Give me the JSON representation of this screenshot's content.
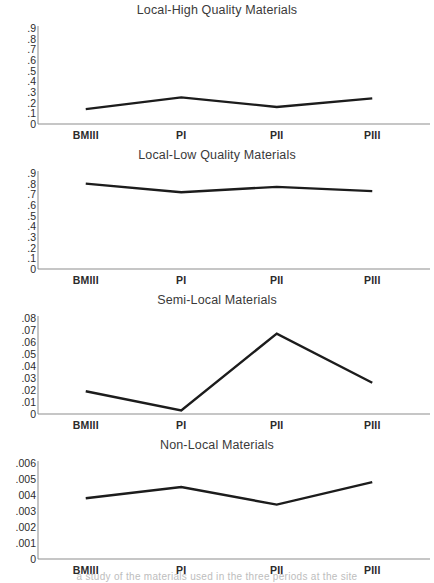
{
  "page": {
    "footer_partial_text": "a study of the materials used in the three periods at the site"
  },
  "chart_data": [
    {
      "type": "line",
      "title": "Local-High Quality Materials",
      "categories": [
        "BMIII",
        "PI",
        "PII",
        "PIII"
      ],
      "values": [
        0.14,
        0.25,
        0.16,
        0.24
      ],
      "yticks": [
        ".9",
        ".8",
        ".7",
        ".6",
        ".5",
        ".4",
        ".3",
        ".2",
        ".1",
        "0"
      ],
      "ytick_values": [
        0.9,
        0.8,
        0.7,
        0.6,
        0.5,
        0.4,
        0.3,
        0.2,
        0.1,
        0
      ],
      "ylim": [
        0,
        0.9
      ],
      "xlabel": "",
      "ylabel": "",
      "grid": false,
      "legend": "none",
      "line_color": "#1c1c1c"
    },
    {
      "type": "line",
      "title": "Local-Low Quality Materials",
      "categories": [
        "BMIII",
        "PI",
        "PII",
        "PIII"
      ],
      "values": [
        0.8,
        0.72,
        0.77,
        0.73
      ],
      "yticks": [
        ".9",
        ".8",
        ".7",
        ".6",
        ".5",
        ".4",
        ".3",
        ".2",
        ".1",
        "0"
      ],
      "ytick_values": [
        0.9,
        0.8,
        0.7,
        0.6,
        0.5,
        0.4,
        0.3,
        0.2,
        0.1,
        0
      ],
      "ylim": [
        0,
        0.9
      ],
      "xlabel": "",
      "ylabel": "",
      "grid": false,
      "legend": "none",
      "line_color": "#1c1c1c"
    },
    {
      "type": "line",
      "title": "Semi-Local Materials",
      "categories": [
        "BMIII",
        "PI",
        "PII",
        "PIII"
      ],
      "values": [
        0.019,
        0.003,
        0.067,
        0.026
      ],
      "yticks": [
        ".08",
        ".07",
        ".06",
        ".05",
        ".04",
        ".03",
        ".02",
        ".01",
        "0"
      ],
      "ytick_values": [
        0.08,
        0.07,
        0.06,
        0.05,
        0.04,
        0.03,
        0.02,
        0.01,
        0
      ],
      "ylim": [
        0,
        0.08
      ],
      "xlabel": "",
      "ylabel": "",
      "grid": false,
      "legend": "none",
      "line_color": "#1c1c1c"
    },
    {
      "type": "line",
      "title": "Non-Local Materials",
      "categories": [
        "BMIII",
        "PI",
        "PII",
        "PIII"
      ],
      "values": [
        0.0038,
        0.0045,
        0.0034,
        0.0048
      ],
      "yticks": [
        ".006",
        ".005",
        "004",
        ".003",
        ".002",
        ".001",
        "0"
      ],
      "ytick_values": [
        0.006,
        0.005,
        0.004,
        0.003,
        0.002,
        0.001,
        0
      ],
      "ylim": [
        0,
        0.006
      ],
      "xlabel": "",
      "ylabel": "",
      "grid": false,
      "legend": "none",
      "line_color": "#1c1c1c"
    }
  ]
}
